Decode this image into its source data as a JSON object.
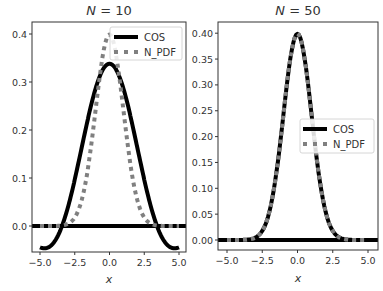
{
  "figure": {
    "width": 383,
    "height": 291,
    "colors": {
      "cos": "#000000",
      "n_pdf": "#808080",
      "axes": "#333333",
      "background": "#ffffff"
    }
  },
  "chart_data": [
    {
      "type": "line",
      "title": "N = 10",
      "title_math": {
        "var": "N",
        "eq": "=",
        "val": "10"
      },
      "xlabel": "x",
      "ylabel": "",
      "xlim": [
        -5.5,
        5.5
      ],
      "ylim": [
        -0.055,
        0.425
      ],
      "xticks": [
        -5.0,
        -2.5,
        0.0,
        2.5,
        5.0
      ],
      "xtick_labels": [
        "−5.0",
        "−2.5",
        "0.0",
        "2.5",
        "5.0"
      ],
      "yticks": [
        0.0,
        0.1,
        0.2,
        0.3,
        0.4
      ],
      "ytick_labels": [
        "0.0",
        "0.1",
        "0.2",
        "0.3",
        "0.4"
      ],
      "grid": false,
      "legend": {
        "position": "upper right",
        "entries": [
          "COS",
          "N_PDF"
        ]
      },
      "series": [
        {
          "name": "COS",
          "style": "solid",
          "color": "#000000",
          "linewidth": 4,
          "description": "scaled cos^N-type curve, peak ~0.338 at x=0, dips to ~-0.032 near x=±3.5, ends ~0.015 at x=±5",
          "x": [
            -5.0,
            -4.5,
            -4.0,
            -3.5,
            -3.0,
            -2.5,
            -2.0,
            -1.5,
            -1.0,
            -0.5,
            0.0,
            0.5,
            1.0,
            1.5,
            2.0,
            2.5,
            3.0,
            3.5,
            4.0,
            4.5,
            5.0
          ],
          "y": [
            0.015,
            -0.008,
            -0.027,
            -0.032,
            -0.015,
            0.025,
            0.092,
            0.17,
            0.248,
            0.31,
            0.338,
            0.31,
            0.248,
            0.17,
            0.092,
            0.025,
            -0.015,
            -0.032,
            -0.027,
            -0.008,
            0.015
          ]
        },
        {
          "name": "N_PDF",
          "style": "dotted",
          "color": "#808080",
          "linewidth": 4,
          "description": "standard normal pdf",
          "x": [
            -5.0,
            -4.5,
            -4.0,
            -3.5,
            -3.0,
            -2.5,
            -2.0,
            -1.5,
            -1.0,
            -0.5,
            0.0,
            0.5,
            1.0,
            1.5,
            2.0,
            2.5,
            3.0,
            3.5,
            4.0,
            4.5,
            5.0
          ],
          "y": [
            0.0,
            0.0,
            0.0001,
            0.0009,
            0.0044,
            0.0175,
            0.054,
            0.1295,
            0.242,
            0.352,
            0.399,
            0.352,
            0.242,
            0.1295,
            0.054,
            0.0175,
            0.0044,
            0.0009,
            0.0001,
            0.0,
            0.0
          ]
        },
        {
          "name": "zero-line",
          "style": "solid",
          "color": "#000000",
          "linewidth": 4,
          "x": [
            -5.5,
            5.5
          ],
          "y": [
            0.0,
            0.0
          ]
        }
      ]
    },
    {
      "type": "line",
      "title": "N = 50",
      "title_math": {
        "var": "N",
        "eq": "=",
        "val": "50"
      },
      "xlabel": "x",
      "ylabel": "",
      "xlim": [
        -5.5,
        5.5
      ],
      "ylim": [
        -0.02,
        0.42
      ],
      "xticks": [
        -5.0,
        -2.5,
        0.0,
        2.5,
        5.0
      ],
      "xtick_labels": [
        "−5.0",
        "−2.5",
        "0.0",
        "2.5",
        "5.0"
      ],
      "yticks": [
        0.0,
        0.05,
        0.1,
        0.15,
        0.2,
        0.25,
        0.3,
        0.35,
        0.4
      ],
      "ytick_labels": [
        "0.00",
        "0.05",
        "0.10",
        "0.15",
        "0.20",
        "0.25",
        "0.30",
        "0.35",
        "0.40"
      ],
      "grid": false,
      "legend": {
        "position": "center right",
        "entries": [
          "COS",
          "N_PDF"
        ]
      },
      "series": [
        {
          "name": "COS",
          "style": "solid",
          "color": "#000000",
          "linewidth": 4,
          "description": "nearly identical to normal pdf, peak ~0.399",
          "x": [
            -5.0,
            -4.5,
            -4.0,
            -3.5,
            -3.0,
            -2.5,
            -2.0,
            -1.5,
            -1.0,
            -0.5,
            0.0,
            0.5,
            1.0,
            1.5,
            2.0,
            2.5,
            3.0,
            3.5,
            4.0,
            4.5,
            5.0
          ],
          "y": [
            0.0,
            0.0,
            0.0001,
            0.0009,
            0.0044,
            0.0175,
            0.054,
            0.1295,
            0.242,
            0.352,
            0.399,
            0.352,
            0.242,
            0.1295,
            0.054,
            0.0175,
            0.0044,
            0.0009,
            0.0001,
            0.0,
            0.0
          ]
        },
        {
          "name": "N_PDF",
          "style": "dotted",
          "color": "#808080",
          "linewidth": 4,
          "description": "standard normal pdf",
          "x": [
            -5.0,
            -4.5,
            -4.0,
            -3.5,
            -3.0,
            -2.5,
            -2.0,
            -1.5,
            -1.0,
            -0.5,
            0.0,
            0.5,
            1.0,
            1.5,
            2.0,
            2.5,
            3.0,
            3.5,
            4.0,
            4.5,
            5.0
          ],
          "y": [
            0.0,
            0.0,
            0.0001,
            0.0009,
            0.0044,
            0.0175,
            0.054,
            0.1295,
            0.242,
            0.352,
            0.399,
            0.352,
            0.242,
            0.1295,
            0.054,
            0.0175,
            0.0044,
            0.0009,
            0.0001,
            0.0,
            0.0
          ]
        },
        {
          "name": "zero-line",
          "style": "solid",
          "color": "#000000",
          "linewidth": 4,
          "x": [
            -5.5,
            5.5
          ],
          "y": [
            0.0,
            0.0
          ]
        }
      ]
    }
  ],
  "panels": [
    {
      "title_var": "N",
      "title_eq": " = ",
      "title_val": "10",
      "xlabel": "x",
      "legend_cos": "COS",
      "legend_pdf": "N_PDF"
    },
    {
      "title_var": "N",
      "title_eq": " = ",
      "title_val": "50",
      "xlabel": "x",
      "legend_cos": "COS",
      "legend_pdf": "N_PDF"
    }
  ]
}
